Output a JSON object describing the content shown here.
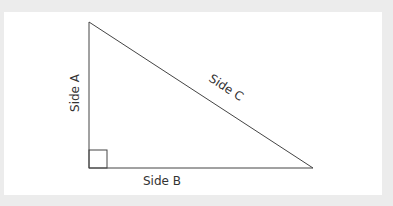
{
  "diagram": {
    "type": "right-triangle",
    "labels": {
      "side_a": "Side A",
      "side_b": "Side B",
      "side_c": "Side C"
    },
    "colors": {
      "background": "#ececec",
      "panel": "#ffffff",
      "stroke": "#444444",
      "text": "#333333"
    },
    "right_angle_marker": true
  }
}
